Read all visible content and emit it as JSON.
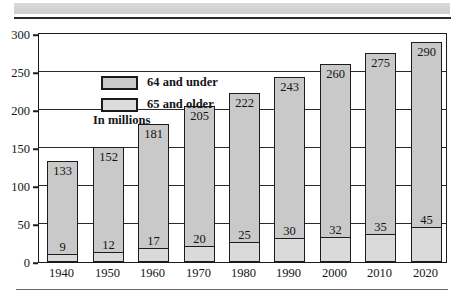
{
  "chart_data": {
    "type": "bar",
    "subtype": "stacked-column",
    "title": "",
    "xlabel": "",
    "ylabel": "",
    "note": "In millions",
    "ylim": [
      0,
      300
    ],
    "yticks": [
      0,
      50,
      100,
      150,
      200,
      250,
      300
    ],
    "grid": true,
    "legend_position": "inside-top-left",
    "categories": [
      "1940",
      "1950",
      "1960",
      "1970",
      "1980",
      "1990",
      "2000",
      "2010",
      "2020"
    ],
    "series": [
      {
        "name": "64 and under",
        "color": "#c9c9c9",
        "values": [
          133,
          152,
          181,
          205,
          222,
          243,
          260,
          275,
          290
        ],
        "note": "values shown are cumulative totals labeled at top of each column"
      },
      {
        "name": "65 and older",
        "color": "#dadada",
        "values": [
          9,
          12,
          17,
          20,
          25,
          30,
          32,
          35,
          45
        ]
      }
    ]
  },
  "legend": {
    "items": [
      {
        "label": "64 and under",
        "swatch": "under"
      },
      {
        "label": "65 and older",
        "swatch": "older"
      }
    ],
    "note": "In millions"
  },
  "axis": {
    "y_labels": [
      "300",
      "250",
      "200",
      "150",
      "100",
      "50",
      "0"
    ],
    "x_labels": [
      "1940",
      "1950",
      "1960",
      "1970",
      "1980",
      "1990",
      "2000",
      "2010",
      "2020"
    ]
  },
  "bars": [
    {
      "year": "1940",
      "total": "133",
      "older": "9"
    },
    {
      "year": "1950",
      "total": "152",
      "older": "12"
    },
    {
      "year": "1960",
      "total": "181",
      "older": "17"
    },
    {
      "year": "1970",
      "total": "205",
      "older": "20"
    },
    {
      "year": "1980",
      "total": "222",
      "older": "25"
    },
    {
      "year": "1990",
      "total": "243",
      "older": "30"
    },
    {
      "year": "2000",
      "total": "260",
      "older": "32"
    },
    {
      "year": "2010",
      "total": "275",
      "older": "35"
    },
    {
      "year": "2020",
      "total": "290",
      "older": "45"
    }
  ],
  "colors": {
    "bar_under": "#c9c9c9",
    "bar_older": "#dadada",
    "outline": "#1c1c1c",
    "strip": "#d4d4d4"
  }
}
